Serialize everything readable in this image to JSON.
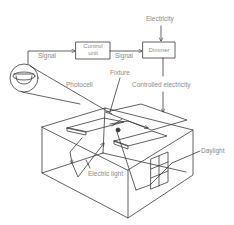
{
  "diagram": {
    "nodes": {
      "control_unit": {
        "label_line1": "Control",
        "label_line2": "unit"
      },
      "dimmer": {
        "label": "Dimmer"
      }
    },
    "labels": {
      "electricity": "Electricity",
      "signal_1": "Signal",
      "signal_2": "Signal",
      "photocell": "Photocell",
      "fixture": "Fixture",
      "controlled_electricity": "Controlled electricity",
      "daylight": "Daylight",
      "electric_light": "Electric light"
    },
    "edges": [
      {
        "from": "photocell",
        "to": "control_unit",
        "label": "Signal"
      },
      {
        "from": "control_unit",
        "to": "dimmer",
        "label": "Signal"
      },
      {
        "from": "electricity",
        "to": "dimmer",
        "label": "Electricity"
      },
      {
        "from": "dimmer",
        "to": "fixture",
        "label": "Controlled electricity"
      }
    ],
    "colors": {
      "line": "#3a3a3a",
      "text": "#8a8a8a",
      "background": "#ffffff"
    }
  }
}
